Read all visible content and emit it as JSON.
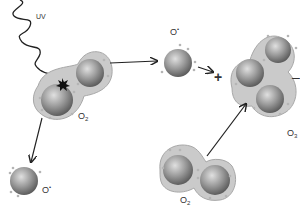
{
  "diagram": {
    "labels": {
      "uv": "UV",
      "o2_top": "O",
      "o2_top_sub": "2",
      "o_radical_bottom": "O",
      "o_radical_bottom_sup": "•",
      "o_radical_top": "O",
      "o_radical_top_sup": "•",
      "plus": "+",
      "o2_bottom": "O",
      "o2_bottom_sub": "2",
      "o3": "O",
      "o3_sub": "3",
      "minus_fragment": "–"
    },
    "colors": {
      "sphere_dark": "#6e6e6e",
      "sphere_light": "#d8d8d8",
      "shell": "#c9c9c9",
      "shell_edge": "#a8a8a8",
      "electron_dot": "#b5b5b5",
      "arrow": "#222222"
    }
  }
}
